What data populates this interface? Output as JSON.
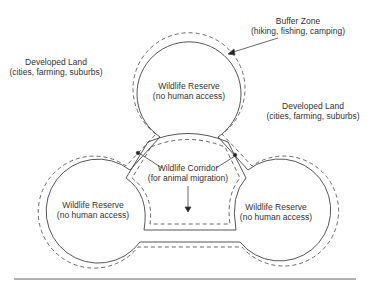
{
  "labels": {
    "buffer_zone": {
      "title": "Buffer Zone",
      "sub": "(hiking, fishing, camping)"
    },
    "developed_left": {
      "title": "Developed Land",
      "sub": "(cities, farming, suburbs)"
    },
    "developed_right": {
      "title": "Developed Land",
      "sub": "(cities, farming, suburbs)"
    },
    "reserve_top": {
      "title": "Wildlife Reserve",
      "sub": "(no human access)"
    },
    "reserve_left": {
      "title": "Wildlife Reserve",
      "sub": "(no human access)"
    },
    "reserve_right": {
      "title": "Wildlife Reserve",
      "sub": "(no human access)"
    },
    "corridor": {
      "title": "Wildlife Corridor",
      "sub": "(for animal migration)"
    }
  },
  "colors": {
    "line": "#444444",
    "text": "#333333",
    "background": "#ffffff"
  }
}
